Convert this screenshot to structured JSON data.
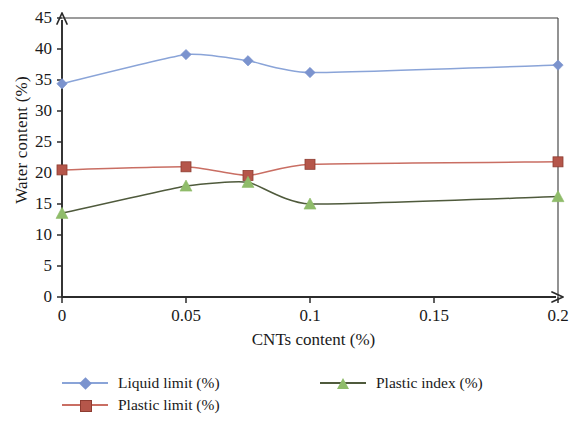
{
  "chart_data": {
    "type": "line",
    "title": "",
    "xlabel": "CNTs content (%)",
    "ylabel": "Water content (%)",
    "x": [
      0,
      0.05,
      0.075,
      0.1,
      0.2
    ],
    "xlim": [
      0,
      0.2
    ],
    "ylim": [
      0,
      45
    ],
    "xticks": [
      "0",
      "0.05",
      "0.1",
      "0.15",
      "0.2"
    ],
    "xtick_values": [
      0,
      0.05,
      0.1,
      0.15,
      0.2
    ],
    "yticks": [
      "0",
      "5",
      "10",
      "15",
      "20",
      "25",
      "30",
      "35",
      "40",
      "45"
    ],
    "ytick_values": [
      0,
      5,
      10,
      15,
      20,
      25,
      30,
      35,
      40,
      45
    ],
    "grid": false,
    "legend_position": "bottom",
    "smooth": true,
    "series": [
      {
        "name": "Liquid limit (%)",
        "values": [
          34.4,
          39.1,
          38.1,
          36.2,
          37.4
        ],
        "line_color": "#8aa4d8",
        "marker_color": "#7b93ce",
        "marker": "diamond"
      },
      {
        "name": "Plastic limit (%)",
        "values": [
          20.5,
          21.0,
          19.6,
          21.4,
          21.8
        ],
        "line_color": "#c96e63",
        "marker_color": "#b5564a",
        "marker": "square"
      },
      {
        "name": "Plastic index (%)",
        "values": [
          13.5,
          17.9,
          18.5,
          15.0,
          16.2
        ],
        "line_color": "#4f5a3c",
        "marker_color": "#8fbc6a",
        "marker": "triangle"
      }
    ]
  },
  "legend": {
    "items": [
      {
        "label": "Liquid limit (%)"
      },
      {
        "label": "Plastic limit (%)"
      },
      {
        "label": "Plastic index (%)"
      }
    ]
  },
  "axes": {
    "x_title": "CNTs content (%)",
    "y_title": "Water content (%)"
  }
}
